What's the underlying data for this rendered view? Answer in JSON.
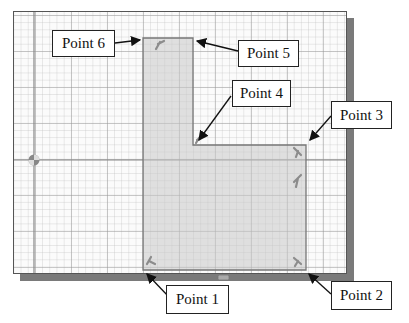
{
  "canvas": {
    "background": "#fbfbfb",
    "grid": "on",
    "profile_fill": "#d9d9d9"
  },
  "callouts": [
    {
      "label": "Point 6"
    },
    {
      "label": "Point 5"
    },
    {
      "label": "Point 4"
    },
    {
      "label": "Point 3"
    },
    {
      "label": "Point 1"
    },
    {
      "label": "Point 2"
    }
  ],
  "icons": {
    "origin": "origin-icon",
    "constraint": "perpendicular-constraint-icon",
    "horizontal": "horizontal-constraint-icon"
  }
}
